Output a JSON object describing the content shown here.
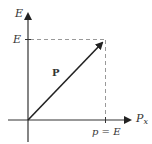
{
  "diagram": {
    "y_axis_label": "E",
    "y_tick_label": "E",
    "x_axis_label_main": "P",
    "x_axis_label_sub": "x",
    "x_tick_label": "p = E",
    "vector_label": "P",
    "colors": {
      "axis": "#333333",
      "vector": "#222222",
      "dashed": "#999999",
      "text": "#333333"
    }
  }
}
